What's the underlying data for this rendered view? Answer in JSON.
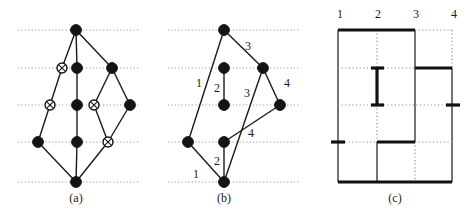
{
  "figure": {
    "background": "#ffffff",
    "ink": "#141414",
    "grid_color": "#9a9a9a",
    "panels": [
      {
        "id": "a",
        "caption": "(a)",
        "caption_x": 76,
        "caption_y": 202
      },
      {
        "id": "b",
        "caption": "(b)",
        "caption_x": 224,
        "caption_y": 202
      },
      {
        "id": "c",
        "caption": "(c)",
        "caption_x": 395,
        "caption_y": 202
      }
    ]
  },
  "panel_a": {
    "caption": "(a)",
    "gridlines": [
      {
        "y": 30,
        "x1": 18,
        "x2": 140
      },
      {
        "y": 68,
        "x1": 18,
        "x2": 140
      },
      {
        "y": 105,
        "x1": 18,
        "x2": 140
      },
      {
        "y": 142,
        "x1": 18,
        "x2": 140
      },
      {
        "y": 182,
        "x1": 18,
        "x2": 140
      }
    ],
    "nodes": [
      {
        "id": "t",
        "x": 76,
        "y": 30,
        "type": "solid"
      },
      {
        "id": "r2a",
        "x": 62,
        "y": 68,
        "type": "hatched"
      },
      {
        "id": "r2b",
        "x": 77,
        "y": 68,
        "type": "solid"
      },
      {
        "id": "r2c",
        "x": 112,
        "y": 68,
        "type": "solid"
      },
      {
        "id": "r3a",
        "x": 50,
        "y": 105,
        "type": "hatched"
      },
      {
        "id": "r3b",
        "x": 77,
        "y": 105,
        "type": "solid"
      },
      {
        "id": "r3c",
        "x": 94,
        "y": 105,
        "type": "hatched"
      },
      {
        "id": "r3d",
        "x": 130,
        "y": 105,
        "type": "solid"
      },
      {
        "id": "r4a",
        "x": 38,
        "y": 142,
        "type": "solid"
      },
      {
        "id": "r4b",
        "x": 77,
        "y": 142,
        "type": "solid"
      },
      {
        "id": "r4c",
        "x": 108,
        "y": 142,
        "type": "hatched"
      },
      {
        "id": "b",
        "x": 76,
        "y": 182,
        "type": "solid"
      }
    ],
    "edges": [
      {
        "from": "t",
        "to": "r2a"
      },
      {
        "from": "t",
        "to": "r2b"
      },
      {
        "from": "t",
        "to": "r2c"
      },
      {
        "from": "r2a",
        "to": "r3a"
      },
      {
        "from": "r2b",
        "to": "r3b"
      },
      {
        "from": "r2c",
        "to": "r3c"
      },
      {
        "from": "r2c",
        "to": "r3d"
      },
      {
        "from": "r3a",
        "to": "r4a"
      },
      {
        "from": "r3b",
        "to": "r4b"
      },
      {
        "from": "r3c",
        "to": "r4c"
      },
      {
        "from": "r3d",
        "to": "r4c"
      },
      {
        "from": "r4a",
        "to": "b"
      },
      {
        "from": "r4b",
        "to": "b"
      },
      {
        "from": "r4c",
        "to": "b"
      }
    ]
  },
  "panel_b": {
    "caption": "(b)",
    "gridlines": [
      {
        "y": 30,
        "x1": 168,
        "x2": 300
      },
      {
        "y": 68,
        "x1": 168,
        "x2": 300
      },
      {
        "y": 105,
        "x1": 168,
        "x2": 300
      },
      {
        "y": 142,
        "x1": 168,
        "x2": 300
      },
      {
        "y": 182,
        "x1": 168,
        "x2": 300
      }
    ],
    "nodes": [
      {
        "id": "t",
        "x": 224,
        "y": 30,
        "type": "solid"
      },
      {
        "id": "m2a",
        "x": 224,
        "y": 68,
        "type": "solid"
      },
      {
        "id": "m2b",
        "x": 263,
        "y": 68,
        "type": "solid"
      },
      {
        "id": "m3a",
        "x": 224,
        "y": 105,
        "type": "solid"
      },
      {
        "id": "m3b",
        "x": 280,
        "y": 105,
        "type": "solid"
      },
      {
        "id": "m4a",
        "x": 188,
        "y": 142,
        "type": "solid"
      },
      {
        "id": "m4b",
        "x": 224,
        "y": 142,
        "type": "solid"
      },
      {
        "id": "b",
        "x": 224,
        "y": 182,
        "type": "solid"
      }
    ],
    "edges": [
      {
        "from": "t",
        "to": "m4a"
      },
      {
        "from": "t",
        "to": "m2b"
      },
      {
        "from": "m2a",
        "to": "m3a"
      },
      {
        "from": "m2b",
        "to": "m3b"
      },
      {
        "from": "m2b",
        "to": "b"
      },
      {
        "from": "m3b",
        "to": "m4b"
      },
      {
        "from": "m4a",
        "to": "b"
      },
      {
        "from": "m4b",
        "to": "b"
      }
    ],
    "edge_labels": [
      {
        "text": "3",
        "x": 248,
        "y": 50
      },
      {
        "text": "1",
        "x": 199,
        "y": 87
      },
      {
        "text": "2",
        "x": 217,
        "y": 92
      },
      {
        "text": "3",
        "x": 247,
        "y": 97
      },
      {
        "text": "4",
        "x": 287,
        "y": 87
      },
      {
        "text": "4",
        "x": 251,
        "y": 137
      },
      {
        "text": "2",
        "x": 217,
        "y": 165
      },
      {
        "text": "1",
        "x": 196,
        "y": 178
      }
    ]
  },
  "panel_c": {
    "caption": "(c)",
    "column_labels": [
      {
        "text": "1",
        "x": 340,
        "y": 18
      },
      {
        "text": "2",
        "x": 378,
        "y": 18
      },
      {
        "text": "3",
        "x": 416,
        "y": 18
      },
      {
        "text": "4",
        "x": 454,
        "y": 18
      }
    ],
    "column_x": [
      338,
      377,
      415,
      452
    ],
    "row_y": [
      30,
      68,
      105,
      142,
      182
    ],
    "vertical_segments": [
      {
        "x": 338,
        "y1": 30,
        "y2": 182,
        "style": "solid"
      },
      {
        "x": 377,
        "y1": 30,
        "y2": 68,
        "style": "dotted"
      },
      {
        "x": 377,
        "y1": 68,
        "y2": 105,
        "style": "thick"
      },
      {
        "x": 377,
        "y1": 105,
        "y2": 142,
        "style": "dotted"
      },
      {
        "x": 377,
        "y1": 142,
        "y2": 182,
        "style": "solid"
      },
      {
        "x": 415,
        "y1": 30,
        "y2": 142,
        "style": "solid"
      },
      {
        "x": 415,
        "y1": 142,
        "y2": 182,
        "style": "dotted"
      },
      {
        "x": 452,
        "y1": 30,
        "y2": 68,
        "style": "dotted"
      },
      {
        "x": 452,
        "y1": 68,
        "y2": 182,
        "style": "solid"
      }
    ],
    "horizontal_segments": [
      {
        "y": 30,
        "x1": 338,
        "x2": 415,
        "style": "thick"
      },
      {
        "y": 30,
        "x1": 415,
        "x2": 452,
        "style": "dotted"
      },
      {
        "y": 68,
        "x1": 338,
        "x2": 371,
        "style": "dotted"
      },
      {
        "y": 68,
        "x1": 371,
        "x2": 384,
        "style": "thick"
      },
      {
        "y": 68,
        "x1": 384,
        "x2": 415,
        "style": "dotted"
      },
      {
        "y": 68,
        "x1": 415,
        "x2": 452,
        "style": "thick"
      },
      {
        "y": 105,
        "x1": 338,
        "x2": 371,
        "style": "dotted"
      },
      {
        "y": 105,
        "x1": 371,
        "x2": 384,
        "style": "thick"
      },
      {
        "y": 105,
        "x1": 384,
        "x2": 446,
        "style": "dotted"
      },
      {
        "y": 105,
        "x1": 446,
        "x2": 460,
        "style": "thick"
      },
      {
        "y": 142,
        "x1": 331,
        "x2": 345,
        "style": "thick"
      },
      {
        "y": 142,
        "x1": 345,
        "x2": 377,
        "style": "dotted"
      },
      {
        "y": 142,
        "x1": 377,
        "x2": 415,
        "style": "thick"
      },
      {
        "y": 142,
        "x1": 415,
        "x2": 452,
        "style": "dotted"
      },
      {
        "y": 182,
        "x1": 338,
        "x2": 452,
        "style": "thick"
      }
    ]
  }
}
